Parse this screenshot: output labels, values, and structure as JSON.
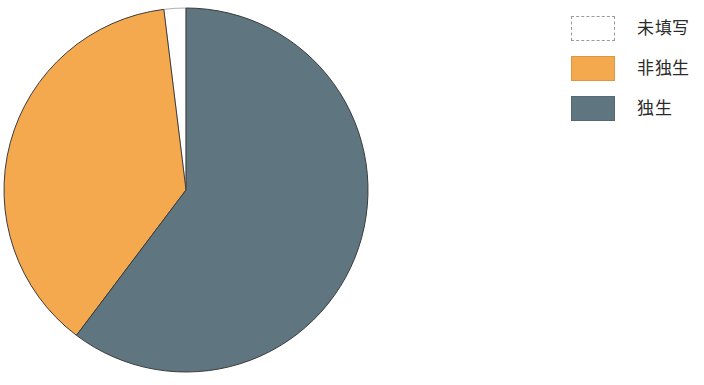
{
  "chart_data": {
    "type": "pie",
    "title": "",
    "subtitle": "",
    "xlabel": "",
    "ylabel": "",
    "grid": false,
    "legend_position": "right",
    "categories": [
      "未填写",
      "非独生",
      "独生"
    ],
    "values": [
      2,
      38,
      60
    ],
    "unit": "%",
    "slices": [
      {
        "label": "未填写",
        "value": 2,
        "percent": 2,
        "color": "#ffffff",
        "edge_color": "#9a9a9a",
        "start_angle_deg": 353,
        "end_angle_deg": 360,
        "sweep_deg": 7
      },
      {
        "label": "非独生",
        "value": 38,
        "percent": 38,
        "color": "#f5a94e",
        "edge_color": "#3c3c3c",
        "start_angle_deg": 217,
        "end_angle_deg": 353,
        "sweep_deg": 136
      },
      {
        "label": "独生",
        "value": 60,
        "percent": 60,
        "color": "#5f757f",
        "edge_color": "#3c3c3c",
        "start_angle_deg": 0,
        "end_angle_deg": 217,
        "sweep_deg": 217
      }
    ],
    "geometry": {
      "center_x": 186,
      "center_y": 190,
      "radius": 182,
      "start_angle_deg": 0,
      "direction": "clockwise"
    }
  },
  "legend": {
    "items": [
      {
        "label": "未填写",
        "color": "#ffffff",
        "style": "dashed-outline"
      },
      {
        "label": "非独生",
        "color": "#f5a94e",
        "style": "solid"
      },
      {
        "label": "独生",
        "color": "#5f757f",
        "style": "solid"
      }
    ]
  },
  "colors": {
    "unfilled": "#ffffff",
    "non_only_child": "#f5a94e",
    "only_child": "#5f757f",
    "outline": "#3c3c3c",
    "legend_dash": "#9a9a9a",
    "text": "#2b2b2b",
    "background": "#ffffff"
  }
}
